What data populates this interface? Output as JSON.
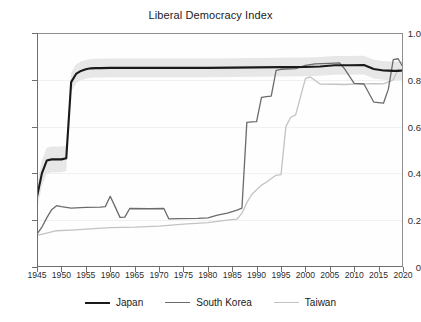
{
  "chart_data": {
    "type": "line",
    "title": "Liberal Democracy Index",
    "xlabel": "",
    "ylabel": "",
    "xlim": [
      1945,
      2020
    ],
    "ylim": [
      0,
      1.0
    ],
    "grid": true,
    "legend_position": "bottom",
    "xticks": [
      1945,
      1950,
      1955,
      1960,
      1965,
      1970,
      1975,
      1980,
      1985,
      1990,
      1995,
      2000,
      2005,
      2010,
      2015,
      2020
    ],
    "xtick_labels": [
      "1945",
      "1950",
      "1955",
      "1960",
      "1965",
      "1970",
      "1975",
      "1980",
      "1985",
      "1990",
      "1995",
      "2000",
      "2005",
      "2010",
      "2015",
      "2020"
    ],
    "yticks": [
      0,
      0.2,
      0.4,
      0.6,
      0.8,
      1.0
    ],
    "ytick_labels": [
      "0",
      "0.2",
      "0.4",
      "0.6",
      "0.8",
      "1.0"
    ],
    "series": [
      {
        "name": "Japan",
        "color": "#1a1a1a",
        "x": [
          1945,
          1946,
          1947,
          1948,
          1949,
          1950,
          1951,
          1952,
          1953,
          1954,
          1955,
          1956,
          1957,
          1958,
          1960,
          1962,
          1965,
          1968,
          1970,
          1975,
          1980,
          1985,
          1990,
          1995,
          2000,
          2003,
          2006,
          2009,
          2012,
          2014,
          2016,
          2017,
          2018,
          2019,
          2020
        ],
        "y": [
          0.3,
          0.4,
          0.455,
          0.46,
          0.46,
          0.46,
          0.465,
          0.79,
          0.825,
          0.838,
          0.845,
          0.849,
          0.85,
          0.85,
          0.851,
          0.851,
          0.851,
          0.851,
          0.851,
          0.851,
          0.851,
          0.852,
          0.853,
          0.854,
          0.855,
          0.857,
          0.862,
          0.862,
          0.863,
          0.846,
          0.84,
          0.839,
          0.838,
          0.838,
          0.84
        ]
      },
      {
        "name": "South Korea",
        "color": "#6b6b6b",
        "x": [
          1945,
          1946,
          1947,
          1948,
          1949,
          1950,
          1952,
          1955,
          1958,
          1959,
          1960,
          1961,
          1962,
          1963,
          1964,
          1968,
          1971,
          1972,
          1974,
          1978,
          1980,
          1982,
          1984,
          1986,
          1987,
          1988,
          1989,
          1990,
          1991,
          1992,
          1993,
          1994,
          1995,
          1998,
          2000,
          2002,
          2005,
          2007,
          2008,
          2010,
          2012,
          2014,
          2016,
          2017,
          2018,
          2019,
          2020
        ],
        "y": [
          0.14,
          0.17,
          0.21,
          0.245,
          0.262,
          0.258,
          0.252,
          0.255,
          0.256,
          0.258,
          0.302,
          0.258,
          0.212,
          0.213,
          0.25,
          0.249,
          0.25,
          0.206,
          0.207,
          0.208,
          0.21,
          0.222,
          0.23,
          0.243,
          0.252,
          0.618,
          0.62,
          0.621,
          0.725,
          0.728,
          0.73,
          0.84,
          0.845,
          0.848,
          0.862,
          0.868,
          0.87,
          0.872,
          0.848,
          0.785,
          0.782,
          0.705,
          0.7,
          0.76,
          0.886,
          0.89,
          0.855
        ]
      },
      {
        "name": "Taiwan",
        "color": "#c3c3c3",
        "x": [
          1945,
          1947,
          1949,
          1952,
          1956,
          1960,
          1965,
          1970,
          1975,
          1980,
          1984,
          1986,
          1987,
          1988,
          1989,
          1990,
          1991,
          1992,
          1993,
          1994,
          1995,
          1996,
          1997,
          1998,
          2000,
          2001,
          2003,
          2006,
          2008,
          2010,
          2012,
          2014,
          2016,
          2018,
          2019,
          2020
        ],
        "y": [
          0.135,
          0.145,
          0.155,
          0.158,
          0.163,
          0.168,
          0.17,
          0.175,
          0.183,
          0.19,
          0.2,
          0.205,
          0.23,
          0.275,
          0.31,
          0.33,
          0.35,
          0.362,
          0.378,
          0.392,
          0.395,
          0.6,
          0.64,
          0.65,
          0.805,
          0.812,
          0.782,
          0.781,
          0.78,
          0.782,
          0.783,
          0.784,
          0.783,
          0.8,
          0.845,
          0.84
        ]
      }
    ],
    "confidence_band": {
      "series": "Japan",
      "color": "#e3e3e3",
      "note": "shaded uncertainty band around Japan line"
    }
  },
  "legend": {
    "items": [
      {
        "label": "Japan",
        "color": "#1a1a1a"
      },
      {
        "label": "South Korea",
        "color": "#6b6b6b"
      },
      {
        "label": "Taiwan",
        "color": "#c3c3c3"
      }
    ]
  }
}
